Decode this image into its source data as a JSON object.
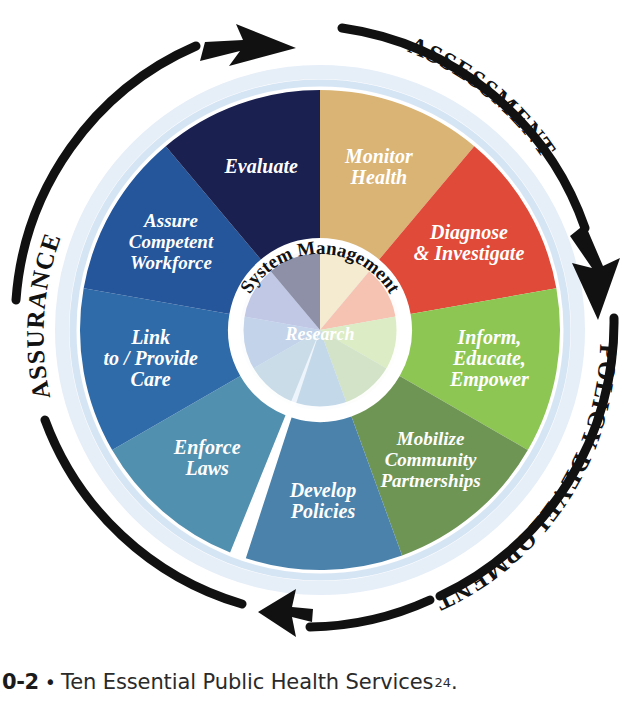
{
  "figure": {
    "title": "Ten Essential Public Health Services",
    "center_hub": {
      "arc_label": "System Management",
      "center_label": "Research"
    },
    "cycle_labels": [
      {
        "id": "assessment",
        "text": "ASSESSMENT"
      },
      {
        "id": "policy-development",
        "text": "POLICY DEVELOPMENT"
      },
      {
        "id": "assurance",
        "text": "ASSURANCE"
      }
    ],
    "segments": [
      {
        "id": "monitor-health",
        "lines": [
          "Monitor",
          "Health"
        ],
        "color": "#d9b475",
        "hub_color": "#f4ebd0",
        "start_angle": 0,
        "end_angle": 40,
        "size": "lg"
      },
      {
        "id": "diagnose-investigate",
        "lines": [
          "Diagnose",
          "& Investigate"
        ],
        "color": "#e04a38",
        "hub_color": "#f6c2b2",
        "start_angle": 40,
        "end_angle": 80,
        "size": "lg"
      },
      {
        "id": "inform-educate-empower",
        "lines": [
          "Inform,",
          "Educate,",
          "Empower"
        ],
        "color": "#8dc653",
        "hub_color": "#dcecc4",
        "start_angle": 80,
        "end_angle": 120,
        "size": "lg"
      },
      {
        "id": "mobilize-community-partnerships",
        "lines": [
          "Mobilize",
          "Community",
          "Partnerships"
        ],
        "color": "#6f9555",
        "hub_color": "#d3e3c8",
        "start_angle": 120,
        "end_angle": 160,
        "size": "md"
      },
      {
        "id": "develop-policies",
        "lines": [
          "Develop",
          "Policies"
        ],
        "color": "#4a82ab",
        "hub_color": "#c3d8e8",
        "start_angle": 160,
        "end_angle": 198,
        "size": "lg"
      },
      {
        "id": "enforce-laws",
        "lines": [
          "Enforce",
          "Laws"
        ],
        "color": "#5290b0",
        "hub_color": "#c9dce8",
        "start_angle": 202,
        "end_angle": 240,
        "size": "lg"
      },
      {
        "id": "link-to-provide-care",
        "lines": [
          "Link",
          "to / Provide",
          "Care"
        ],
        "color": "#2f6ba8",
        "hub_color": "#c2d3ea",
        "start_angle": 240,
        "end_angle": 280,
        "size": "lg"
      },
      {
        "id": "assure-competent-workforce",
        "lines": [
          "Assure",
          "Competent",
          "Workforce"
        ],
        "color": "#25559a",
        "hub_color": "#c0c8e6",
        "start_angle": 280,
        "end_angle": 320,
        "size": "md"
      },
      {
        "id": "evaluate",
        "lines": [
          "Evaluate"
        ],
        "color": "#1a2050",
        "hub_color": "#8e90a8",
        "start_angle": 320,
        "end_angle": 360,
        "size": "lg"
      }
    ]
  },
  "caption": {
    "number": "0-2",
    "bullet": "•",
    "text": "Ten Essential Public Health Services",
    "superscript": "24",
    "period": "."
  },
  "colors": {
    "ring_outer": "#ffffff",
    "ring_glow": "#cfe0f2",
    "divider": "#ffffff",
    "arrow": "#111111",
    "background": "#ffffff"
  }
}
